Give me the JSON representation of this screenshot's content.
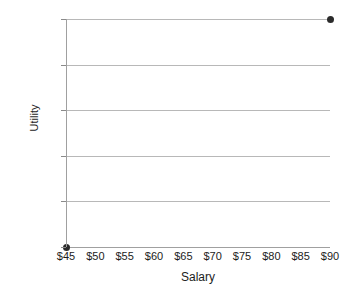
{
  "chart_data": {
    "type": "scatter",
    "title": "",
    "xlabel": "Salary",
    "ylabel": "Utility",
    "xlim": [
      45,
      90
    ],
    "ylim": [
      0,
      100
    ],
    "grid": true,
    "legend": false,
    "x_tick_labels": [
      "$45",
      "$50",
      "$55",
      "$60",
      "$65",
      "$70",
      "$75",
      "$80",
      "$85",
      "$90"
    ],
    "x_tick_values": [
      45,
      50,
      55,
      60,
      65,
      70,
      75,
      80,
      85,
      90
    ],
    "y_tick_labels": [
      "0",
      "20",
      "40",
      "60",
      "80",
      "100"
    ],
    "y_tick_values": [
      0,
      20,
      40,
      60,
      80,
      100
    ],
    "points": [
      {
        "x": 45,
        "y": 0,
        "label": "$45"
      },
      {
        "x": 90,
        "y": 100,
        "label": "$90"
      }
    ],
    "marker_color": "#2b2b2b",
    "gridline_color": "#b8b8b8",
    "axis_color": "#a0a0a0",
    "background_color": "#ffffff"
  }
}
